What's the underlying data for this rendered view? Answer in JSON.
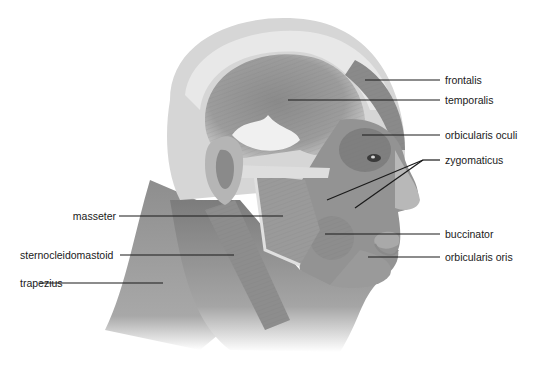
{
  "diagram": {
    "labels_right": [
      {
        "id": "frontalis",
        "text": "frontalis",
        "y": 80,
        "line": {
          "x1": 365,
          "y1": 80,
          "x2": 440,
          "y2": 80
        }
      },
      {
        "id": "temporalis",
        "text": "temporalis",
        "y": 100,
        "line": {
          "x1": 288,
          "y1": 100,
          "x2": 440,
          "y2": 100
        }
      },
      {
        "id": "orbicularis-oculi",
        "text": "orbicularis oculi",
        "y": 135,
        "line": {
          "x1": 362,
          "y1": 135,
          "x2": 440,
          "y2": 135
        }
      },
      {
        "id": "zygomaticus",
        "text": "zygomaticus",
        "y": 160,
        "line": {
          "x1": 423,
          "y1": 160,
          "x2": 440,
          "y2": 160
        }
      },
      {
        "id": "buccinator",
        "text": "buccinator",
        "y": 234,
        "line": {
          "x1": 325,
          "y1": 234,
          "x2": 440,
          "y2": 234
        }
      },
      {
        "id": "orbicularis-oris",
        "text": "orbicularis oris",
        "y": 257,
        "line": {
          "x1": 368,
          "y1": 257,
          "x2": 440,
          "y2": 257
        }
      }
    ],
    "labels_left": [
      {
        "id": "masseter",
        "text": "masseter",
        "y": 216,
        "line": {
          "x1": 119,
          "y1": 216,
          "x2": 283,
          "y2": 216
        }
      },
      {
        "id": "sternocleidomastoid",
        "text": "sternocleidomastoid",
        "y": 255,
        "line": {
          "x1": 120,
          "y1": 255,
          "x2": 234,
          "y2": 255
        }
      },
      {
        "id": "trapezius",
        "text": "trapezius",
        "y": 283,
        "line": {
          "x1": 40,
          "y1": 283,
          "x2": 163,
          "y2": 283
        }
      }
    ],
    "zygomaticus_leaders": [
      {
        "x1": 423,
        "y1": 160,
        "x2": 327,
        "y2": 200
      },
      {
        "x1": 423,
        "y1": 160,
        "x2": 355,
        "y2": 208
      }
    ],
    "colors": {
      "muscle_dark": "#7a7a7a",
      "muscle_mid": "#9a9a9a",
      "muscle_light": "#bdbdbd",
      "tendon": "#e6e6e6",
      "leader_line": "#1a1a1a",
      "label_text": "#1a1a1a"
    }
  }
}
